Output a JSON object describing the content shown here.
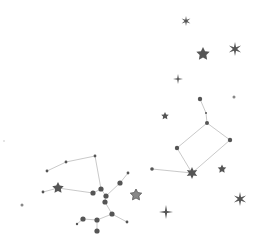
{
  "image": {
    "subject": "constellation illustration",
    "background": "#ffffff",
    "ink_color": "#555555",
    "line_color": "#bbbbbb"
  },
  "constellations": [
    {
      "name": "upper-right-constellation",
      "points": [
        [
          200,
          99
        ],
        [
          206,
          113
        ],
        [
          207,
          123
        ],
        [
          230,
          140
        ],
        [
          192,
          173
        ],
        [
          177,
          148
        ],
        [
          152,
          169
        ]
      ],
      "lines": [
        [
          0,
          1
        ],
        [
          1,
          2
        ],
        [
          2,
          3
        ],
        [
          3,
          4
        ],
        [
          4,
          5
        ],
        [
          5,
          2
        ],
        [
          4,
          6
        ]
      ],
      "point_sizes": [
        2.2,
        1,
        2,
        2.2,
        0,
        2.2,
        1.8
      ],
      "star_shapes": [
        {
          "index": 4,
          "size": 6,
          "points": 6
        }
      ]
    },
    {
      "name": "lower-left-constellation",
      "points": [
        [
          47,
          171
        ],
        [
          66,
          162
        ],
        [
          95,
          156
        ],
        [
          58,
          188
        ],
        [
          43,
          192
        ],
        [
          93,
          193
        ],
        [
          101,
          189
        ],
        [
          106,
          196
        ],
        [
          105,
          202
        ],
        [
          120,
          183
        ],
        [
          128,
          173
        ],
        [
          112,
          214
        ],
        [
          127,
          222
        ],
        [
          97,
          220
        ],
        [
          83,
          219
        ],
        [
          77,
          224
        ],
        [
          97,
          231
        ]
      ],
      "lines": [
        [
          0,
          1
        ],
        [
          1,
          2
        ],
        [
          2,
          6
        ],
        [
          4,
          3
        ],
        [
          3,
          5
        ],
        [
          5,
          6
        ],
        [
          6,
          7
        ],
        [
          7,
          8
        ],
        [
          8,
          11
        ],
        [
          7,
          9
        ],
        [
          9,
          10
        ],
        [
          11,
          12
        ],
        [
          11,
          13
        ],
        [
          13,
          14
        ],
        [
          14,
          15
        ],
        [
          13,
          16
        ]
      ],
      "point_sizes": [
        1.4,
        1.4,
        1.4,
        0,
        1.4,
        2.6,
        2.6,
        2.6,
        2.6,
        2.6,
        1.4,
        2.6,
        1.4,
        2.6,
        2.6,
        1.2,
        2.6
      ],
      "star_shapes": [
        {
          "index": 3,
          "size": 6,
          "points": 5
        }
      ]
    }
  ],
  "loose_stars": [
    {
      "x": 186,
      "y": 21,
      "size": 5,
      "shape": "sparkle6"
    },
    {
      "x": 203,
      "y": 54,
      "size": 7,
      "shape": "star5"
    },
    {
      "x": 235,
      "y": 49,
      "size": 7,
      "shape": "sparkle6"
    },
    {
      "x": 178,
      "y": 79,
      "size": 5,
      "shape": "sparkle4"
    },
    {
      "x": 234,
      "y": 97,
      "size": 1.5,
      "shape": "dot"
    },
    {
      "x": 165,
      "y": 116,
      "size": 4,
      "shape": "star5"
    },
    {
      "x": 222,
      "y": 169,
      "size": 4.5,
      "shape": "star5"
    },
    {
      "x": 136,
      "y": 195,
      "size": 6,
      "shape": "star5outline"
    },
    {
      "x": 22,
      "y": 205,
      "size": 1.5,
      "shape": "dot"
    },
    {
      "x": 166,
      "y": 212,
      "size": 7,
      "shape": "sparkle4"
    },
    {
      "x": 240,
      "y": 199,
      "size": 7,
      "shape": "sparkle6"
    },
    {
      "x": 4,
      "y": 141,
      "size": 1,
      "shape": "faint-dot"
    }
  ]
}
